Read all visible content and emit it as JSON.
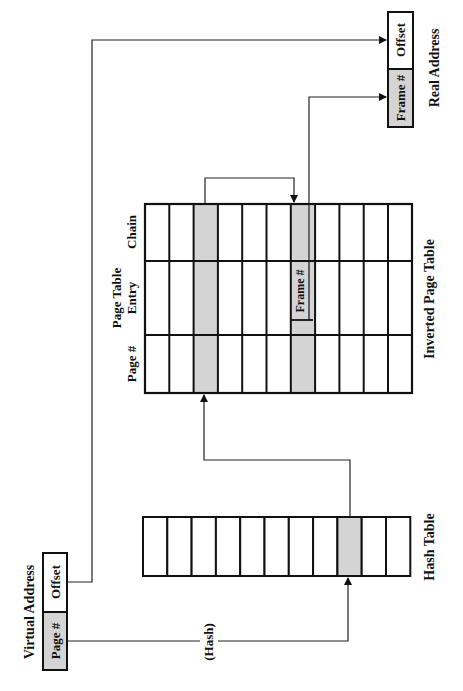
{
  "diagram": {
    "colors": {
      "highlight": "#d4d4d4",
      "line": "#111111",
      "background": "#ffffff"
    },
    "virtual_address": {
      "label": "Virtual Address",
      "fields": [
        "Page #",
        "Offset"
      ]
    },
    "real_address": {
      "label": "Real Address",
      "fields": [
        "Frame #",
        "Offset"
      ]
    },
    "hash_function_label": "(Hash)",
    "hash_table": {
      "label": "Hash Table",
      "cell_count": 11,
      "highlighted_index": 8
    },
    "inverted_page_table": {
      "label": "Inverted Page Table",
      "column_headers": [
        "Page #",
        "Page Table Entry",
        "Chain"
      ],
      "entry_header_lines": [
        "Page Table",
        "Entry"
      ],
      "row_count": 11,
      "highlighted_rows": [
        2,
        6
      ],
      "frame_label": "Frame #"
    }
  }
}
